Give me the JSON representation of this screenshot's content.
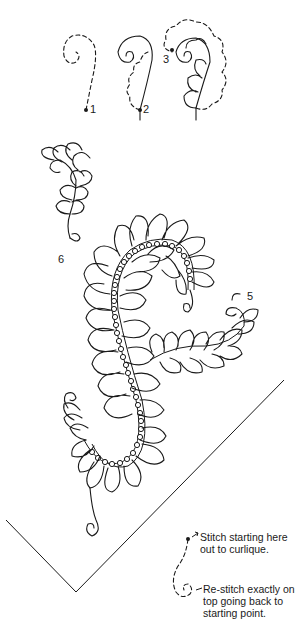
{
  "figure": {
    "type": "quilting feather stitch diagram",
    "steps": [
      {
        "label": "1",
        "description": "dashed curl path with start dot"
      },
      {
        "label": "2",
        "description": "curl stitched with dashed feather outlines"
      },
      {
        "label": "3",
        "description": "feather plumes partially stitched with dashed guides"
      }
    ],
    "feather_labels": {
      "five": "5",
      "six": "6"
    },
    "notes": {
      "start": "Stitch starting here out to curlique.",
      "restitch": "Re-stitch exactly on top going back to starting point."
    },
    "colors": {
      "ink": "#1a1a1a",
      "background": "#ffffff"
    }
  }
}
